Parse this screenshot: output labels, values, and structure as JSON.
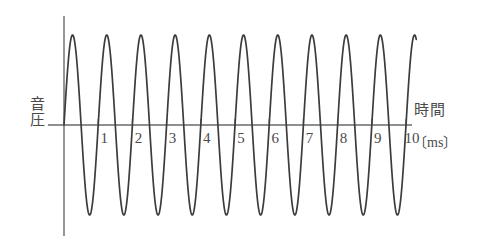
{
  "figure": {
    "title_visible": false,
    "background_color": "#ffffff",
    "ink_color": "#4a4a4a",
    "wave_color": "#3c3c3c"
  },
  "axes": {
    "y_axis_label": "音圧",
    "x_axis_label": "時間",
    "x_axis_unit": "〔ms〕",
    "y_axis_name": "vertical-axis",
    "x_axis_name": "horizontal-axis"
  },
  "chart_data": {
    "type": "line",
    "title": "",
    "xlabel": "時間",
    "ylabel": "音圧",
    "x_unit": "ms",
    "xlim": [
      0,
      10.3
    ],
    "ylim": [
      -1.15,
      1.15
    ],
    "grid": false,
    "legend": null,
    "tick_labels": [
      "1",
      "2",
      "3",
      "4",
      "5",
      "6",
      "7",
      "8",
      "9",
      "10"
    ],
    "tick_values": [
      1,
      2,
      3,
      4,
      5,
      6,
      7,
      8,
      9,
      10
    ],
    "y_ticks": [],
    "series": [
      {
        "name": "sound-pressure-waveform",
        "waveform": "sine",
        "frequency_hz": 1000,
        "period_ms": 1.0,
        "amplitude": 1.0,
        "phase_deg": 0,
        "cycles_drawn": 10.3,
        "x_start_ms": 0,
        "x_end_ms": 10.3
      }
    ]
  },
  "geometry": {
    "origin_x_px": 64,
    "origin_y_px": 125,
    "px_per_ms": 34.2,
    "amplitude_px": 90,
    "y_axis_top_px": 16,
    "y_axis_bottom_px": 236,
    "x_axis_right_px": 412
  }
}
